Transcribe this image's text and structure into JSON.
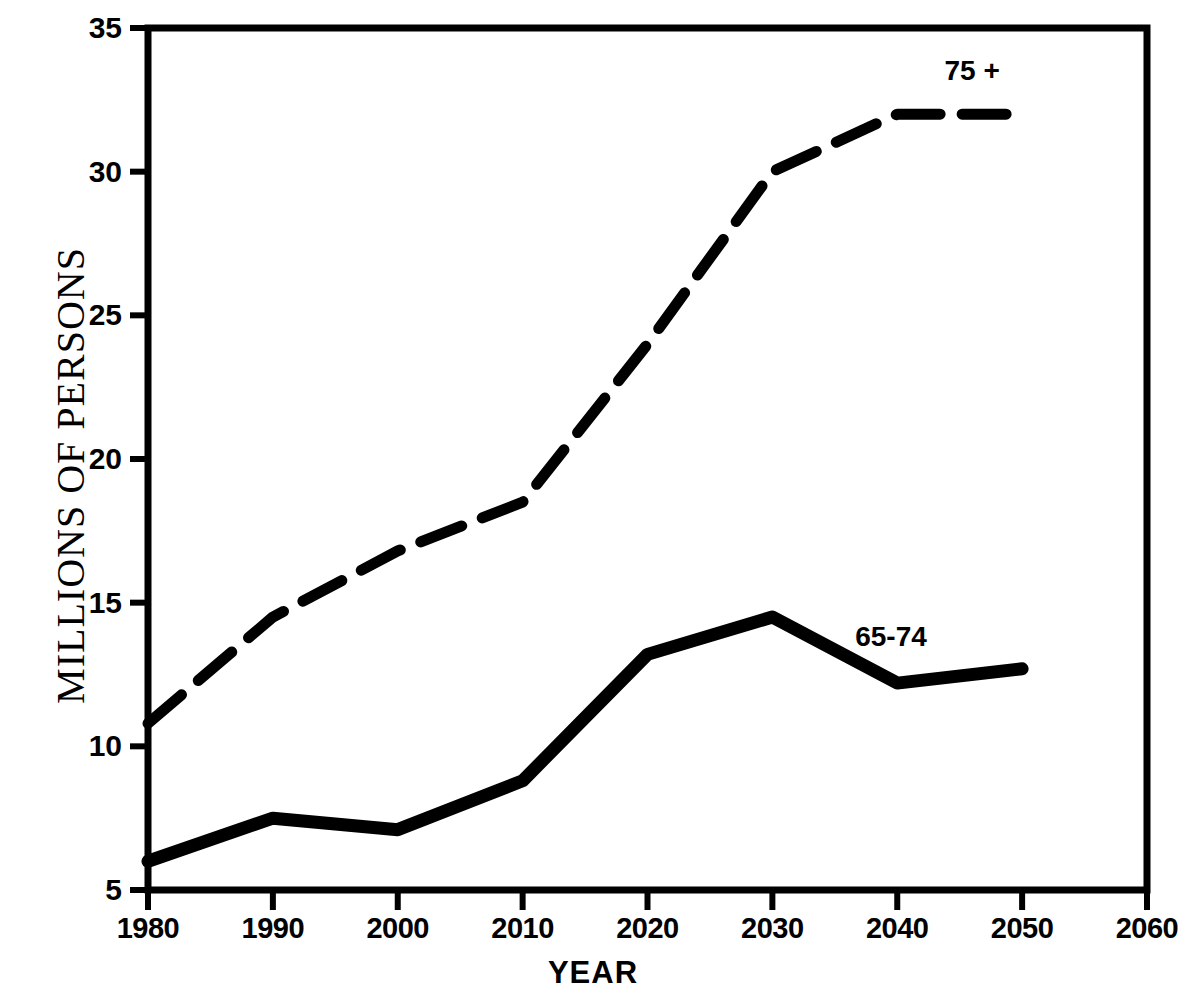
{
  "chart_data": {
    "type": "line",
    "title": "",
    "xlabel": "YEAR",
    "ylabel": "MILLIONS OF PERSONS",
    "x": [
      1980,
      1990,
      2000,
      2010,
      2020,
      2030,
      2040,
      2050
    ],
    "xticks": [
      "1980",
      "1990",
      "2000",
      "2010",
      "2020",
      "2030",
      "2040",
      "2050",
      "2060"
    ],
    "xtick_values": [
      1980,
      1990,
      2000,
      2010,
      2020,
      2030,
      2040,
      2050,
      2060
    ],
    "yticks": [
      "5",
      "10",
      "15",
      "20",
      "25",
      "30",
      "35"
    ],
    "ytick_values": [
      5,
      10,
      15,
      20,
      25,
      30,
      35
    ],
    "xlim": [
      1980,
      2060
    ],
    "ylim": [
      5,
      35
    ],
    "grid": false,
    "legend_position": "inline-annotation",
    "series": [
      {
        "name": "75 +",
        "style": "dashed",
        "label": "75 +",
        "label_x": 2046,
        "label_y": 33.5,
        "values": [
          10.8,
          14.5,
          16.8,
          18.5,
          24.0,
          30.0,
          32.0,
          32.0
        ]
      },
      {
        "name": "65-74",
        "style": "solid",
        "label": "65-74",
        "label_x": 2039.5,
        "label_y": 13.8,
        "values": [
          6.0,
          7.5,
          7.1,
          8.8,
          13.2,
          14.5,
          12.2,
          12.7
        ]
      }
    ],
    "colors": {
      "line": "#000000",
      "axis": "#000000",
      "background": "#ffffff"
    }
  }
}
